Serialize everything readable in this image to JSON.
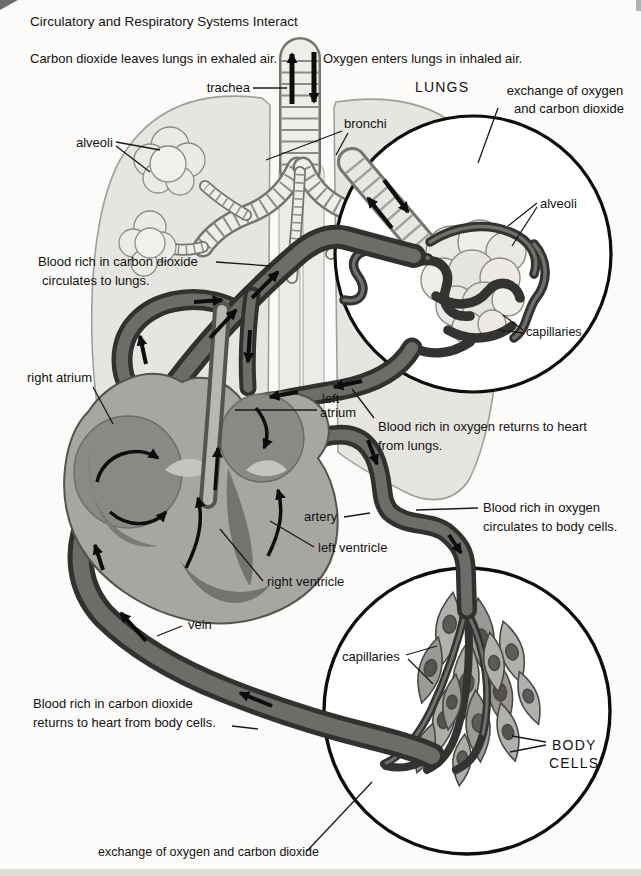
{
  "figure": {
    "type": "anatomy-diagram",
    "subject": "circulatory and respiratory systems"
  },
  "labels": {
    "title": "Circulatory and Respiratory Systems Interact",
    "exhaled": "Carbon dioxide leaves lungs in exhaled air.",
    "inhaled": "Oxygen enters lungs in inhaled air.",
    "trachea": "trachea",
    "lungs_caption": "LUNGS",
    "exchange_top": [
      "exchange of oxygen",
      "and carbon dioxide"
    ],
    "alveoli_lung": "alveoli",
    "bronchi": "bronchi",
    "co2_to_lungs": [
      "Blood rich in carbon dioxide",
      "circulates to lungs."
    ],
    "alveoli_inset": "alveoli",
    "capillaries_inset": "capillaries",
    "right_atrium": "right atrium",
    "left_atrium": [
      "left",
      "atrium"
    ],
    "o2_to_heart": [
      "Blood rich in oxygen returns to heart",
      "from lungs."
    ],
    "artery": "artery",
    "o2_to_body": [
      "Blood rich in oxygen",
      "circulates to body cells."
    ],
    "left_ventricle": "left ventricle",
    "right_ventricle": "right ventricle",
    "vein": "vein",
    "co2_to_heart": [
      "Blood rich in carbon dioxide",
      "returns to heart from body cells."
    ],
    "capillaries_body": "capillaries",
    "body_cells": [
      "BODY",
      "CELLS"
    ],
    "exchange_bottom": "exchange of oxygen and carbon dioxide"
  },
  "colors": {
    "background": "#fcfbfa",
    "ink": "#121212",
    "vessel_dark": "#33312f",
    "vessel_mid": "#6e6c68",
    "heart_tissue": "#a8a6a2",
    "lung_tissue": "#e7e5e1",
    "cell_tissue": "#a5a39f"
  }
}
